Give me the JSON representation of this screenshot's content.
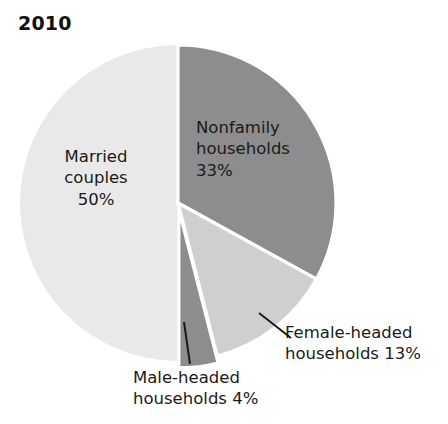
{
  "chart_data": {
    "type": "pie",
    "title": "2010",
    "xlabel": "",
    "ylabel": "",
    "legend_position": "none",
    "grid": false,
    "categories": [
      "Nonfamily households",
      "Female-headed households",
      "Male-headed households",
      "Married couples"
    ],
    "values": [
      33,
      13,
      4,
      50
    ],
    "unit": "%",
    "slices": [
      {
        "name": "Nonfamily households",
        "value": 33,
        "label_line1": "Nonfamily",
        "label_line2": "households",
        "label_line3": "33%",
        "label_text": "Nonfamily\nhouseholds\n33%",
        "color": "#8d8d8d",
        "exploded": false,
        "leader_line": false
      },
      {
        "name": "Female-headed households",
        "value": 13,
        "label_line1": "Female-headed",
        "label_line2": "households 13%",
        "label_text": "Female-headed\nhouseholds 13%",
        "color": "#cfcfcf",
        "exploded": false,
        "leader_line": true
      },
      {
        "name": "Male-headed households",
        "value": 4,
        "label_line1": "Male-headed",
        "label_line2": "households 4%",
        "label_text": "Male-headed\nhouseholds 4%",
        "color": "#8d8d8d",
        "exploded": true,
        "leader_line": true
      },
      {
        "name": "Married couples",
        "value": 50,
        "label_line1": "Married",
        "label_line2": "couples",
        "label_line3": "50%",
        "label_text": "Married\ncouples\n50%",
        "color": "#e9e9e9",
        "exploded": false,
        "leader_line": false
      }
    ],
    "colors": {
      "nonfamily": "#8d8d8d",
      "female_headed": "#cfcfcf",
      "male_headed": "#8d8d8d",
      "married_couples": "#e9e9e9",
      "separator": "#ffffff",
      "leader_line": "#1a1a1a",
      "text": "#1a1a1a",
      "background": "#ffffff"
    },
    "geometry": {
      "center_x": 178,
      "center_y": 203,
      "radius": 158,
      "start_angle_deg": 0
    }
  }
}
